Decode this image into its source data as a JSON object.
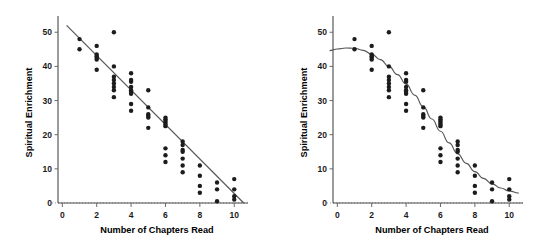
{
  "figure": {
    "title": "",
    "panels": [
      {
        "id": "left",
        "fit_label": "linear-fit"
      },
      {
        "id": "right",
        "fit_label": "curved-fit"
      }
    ]
  },
  "chart_data": [
    {
      "type": "scatter",
      "id": "left-panel",
      "title": "",
      "xlabel": "Number of Chapters Read",
      "ylabel": "Spiritual Enrichment",
      "xlim": [
        -0.6,
        10.8
      ],
      "ylim": [
        0,
        53
      ],
      "xticks": [
        0,
        2,
        4,
        6,
        8,
        10
      ],
      "xtick_labels": [
        "0",
        "2",
        "4",
        "6",
        "8",
        "10"
      ],
      "yticks": [
        0,
        10,
        20,
        30,
        40,
        50
      ],
      "ytick_labels": [
        "0",
        "10",
        "20",
        "30",
        "40",
        "50"
      ],
      "grid": false,
      "legend": "none",
      "points": [
        [
          1,
          48
        ],
        [
          1,
          45
        ],
        [
          2,
          46
        ],
        [
          2,
          43.5
        ],
        [
          2,
          43
        ],
        [
          2,
          42.5
        ],
        [
          2,
          42
        ],
        [
          2,
          39
        ],
        [
          3,
          50
        ],
        [
          3,
          40
        ],
        [
          3,
          37
        ],
        [
          3,
          36
        ],
        [
          3,
          35
        ],
        [
          3,
          34
        ],
        [
          3,
          33
        ],
        [
          3,
          31
        ],
        [
          4,
          38
        ],
        [
          4,
          36
        ],
        [
          4,
          35.5
        ],
        [
          4,
          34
        ],
        [
          4,
          33
        ],
        [
          4,
          32.5
        ],
        [
          4,
          32
        ],
        [
          4,
          29
        ],
        [
          4,
          27
        ],
        [
          5,
          33
        ],
        [
          5,
          28
        ],
        [
          5,
          26
        ],
        [
          5,
          25.5
        ],
        [
          5,
          25
        ],
        [
          5,
          22
        ],
        [
          6,
          25
        ],
        [
          6,
          24.5
        ],
        [
          6,
          24
        ],
        [
          6,
          23.5
        ],
        [
          6,
          23
        ],
        [
          6,
          22.5
        ],
        [
          6,
          16
        ],
        [
          6,
          14
        ],
        [
          6,
          12
        ],
        [
          7,
          18
        ],
        [
          7,
          17
        ],
        [
          7,
          15.5
        ],
        [
          7,
          15
        ],
        [
          7,
          13
        ],
        [
          7,
          11
        ],
        [
          7,
          9
        ],
        [
          8,
          11
        ],
        [
          8,
          8
        ],
        [
          8,
          5
        ],
        [
          8,
          3
        ],
        [
          9,
          6
        ],
        [
          9,
          4
        ],
        [
          9,
          0.5
        ],
        [
          10,
          7
        ],
        [
          10,
          4
        ],
        [
          10,
          2
        ],
        [
          10,
          1
        ]
      ],
      "fit": {
        "kind": "line",
        "label": "linear regression line",
        "path": [
          [
            0.25,
            52
          ],
          [
            10.55,
            0
          ]
        ]
      }
    },
    {
      "type": "scatter",
      "id": "right-panel",
      "title": "",
      "xlabel": "Number of Chapters Read",
      "ylabel": "Spiritual Enrichment",
      "xlim": [
        -0.6,
        10.8
      ],
      "ylim": [
        0,
        53
      ],
      "xticks": [
        0,
        2,
        4,
        6,
        8,
        10
      ],
      "xtick_labels": [
        "0",
        "2",
        "4",
        "6",
        "8",
        "10"
      ],
      "yticks": [
        0,
        10,
        20,
        30,
        40,
        50
      ],
      "ytick_labels": [
        "0",
        "10",
        "20",
        "30",
        "40",
        "50"
      ],
      "grid": false,
      "legend": "none",
      "points": [
        [
          1,
          48
        ],
        [
          1,
          45
        ],
        [
          2,
          46
        ],
        [
          2,
          43.5
        ],
        [
          2,
          43
        ],
        [
          2,
          42.5
        ],
        [
          2,
          42
        ],
        [
          2,
          39
        ],
        [
          3,
          50
        ],
        [
          3,
          40
        ],
        [
          3,
          37
        ],
        [
          3,
          36
        ],
        [
          3,
          35
        ],
        [
          3,
          34
        ],
        [
          3,
          33
        ],
        [
          3,
          31
        ],
        [
          4,
          38
        ],
        [
          4,
          36
        ],
        [
          4,
          35.5
        ],
        [
          4,
          34
        ],
        [
          4,
          33
        ],
        [
          4,
          32.5
        ],
        [
          4,
          32
        ],
        [
          4,
          29
        ],
        [
          4,
          27
        ],
        [
          5,
          33
        ],
        [
          5,
          28
        ],
        [
          5,
          26
        ],
        [
          5,
          25.5
        ],
        [
          5,
          25
        ],
        [
          5,
          22
        ],
        [
          6,
          25
        ],
        [
          6,
          24.5
        ],
        [
          6,
          24
        ],
        [
          6,
          23.5
        ],
        [
          6,
          23
        ],
        [
          6,
          22.5
        ],
        [
          6,
          16
        ],
        [
          6,
          14
        ],
        [
          6,
          12
        ],
        [
          7,
          18
        ],
        [
          7,
          17
        ],
        [
          7,
          15.5
        ],
        [
          7,
          15
        ],
        [
          7,
          13
        ],
        [
          7,
          11
        ],
        [
          7,
          9
        ],
        [
          8,
          11
        ],
        [
          8,
          8
        ],
        [
          8,
          5
        ],
        [
          8,
          3
        ],
        [
          9,
          6
        ],
        [
          9,
          4
        ],
        [
          9,
          0.5
        ],
        [
          10,
          7
        ],
        [
          10,
          4
        ],
        [
          10,
          2
        ],
        [
          10,
          1
        ]
      ],
      "fit": {
        "kind": "curve",
        "label": "sigmoid smoothed fit",
        "path": [
          [
            -0.45,
            44.6
          ],
          [
            0.0,
            45.1
          ],
          [
            0.5,
            45.4
          ],
          [
            1.0,
            45.3
          ],
          [
            1.5,
            44.7
          ],
          [
            2.0,
            43.6
          ],
          [
            2.5,
            42.0
          ],
          [
            3.0,
            40.0
          ],
          [
            3.5,
            37.6
          ],
          [
            4.0,
            34.8
          ],
          [
            4.5,
            31.6
          ],
          [
            5.0,
            28.2
          ],
          [
            5.5,
            24.6
          ],
          [
            6.0,
            21.0
          ],
          [
            6.5,
            17.6
          ],
          [
            7.0,
            14.4
          ],
          [
            7.5,
            11.6
          ],
          [
            8.0,
            9.2
          ],
          [
            8.5,
            7.2
          ],
          [
            9.0,
            5.6
          ],
          [
            9.5,
            4.4
          ],
          [
            10.0,
            3.5
          ],
          [
            10.55,
            2.9
          ]
        ]
      }
    }
  ]
}
